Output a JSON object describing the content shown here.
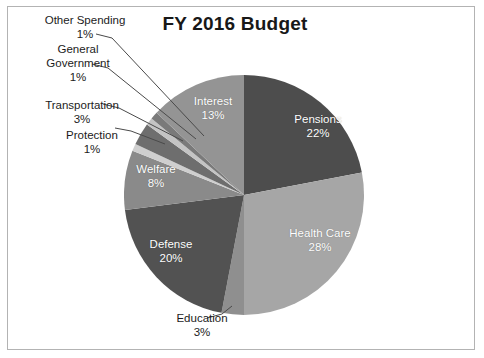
{
  "chart_data": {
    "type": "pie",
    "title": "FY 2016 Budget",
    "xlabel": "",
    "ylabel": "",
    "legend": "none",
    "grid": false,
    "labels_inside": [
      "Pensions",
      "Health Care",
      "Defense",
      "Welfare",
      "Interest"
    ],
    "labels_outside": [
      "Education",
      "Protection",
      "Transportation",
      "General Government",
      "Other Spending"
    ],
    "categories": [
      "Pensions",
      "Health Care",
      "Education",
      "Defense",
      "Welfare",
      "Protection",
      "Transportation",
      "General Government",
      "Other Spending",
      "Interest"
    ],
    "values": [
      22,
      28,
      3,
      20,
      8,
      1,
      3,
      1,
      1,
      13
    ],
    "value_labels": [
      "22%",
      "28%",
      "3%",
      "20%",
      "8%",
      "1%",
      "3%",
      "1%",
      "1%",
      "13%"
    ],
    "units": "percent",
    "total": 100,
    "slices": [
      {
        "name": "Pensions",
        "value": 22,
        "value_label": "22%",
        "color": "#4d4d4d",
        "label_position": "inside",
        "start_deg": 0,
        "end_deg": 79.2
      },
      {
        "name": "Health Care",
        "value": 28,
        "value_label": "28%",
        "color": "#a6a6a6",
        "label_position": "inside",
        "start_deg": 79.2,
        "end_deg": 180.0
      },
      {
        "name": "Education",
        "value": 3,
        "value_label": "3%",
        "color": "#8f8f8f",
        "label_position": "outside",
        "start_deg": 180.0,
        "end_deg": 190.8
      },
      {
        "name": "Defense",
        "value": 20,
        "value_label": "20%",
        "color": "#525252",
        "label_position": "inside",
        "start_deg": 190.8,
        "end_deg": 262.8
      },
      {
        "name": "Welfare",
        "value": 8,
        "value_label": "8%",
        "color": "#8a8a8a",
        "label_position": "inside",
        "start_deg": 262.8,
        "end_deg": 291.6
      },
      {
        "name": "Protection",
        "value": 1,
        "value_label": "1%",
        "color": "#cfcfcf",
        "label_position": "outside",
        "start_deg": 291.6,
        "end_deg": 295.2
      },
      {
        "name": "Transportation",
        "value": 3,
        "value_label": "3%",
        "color": "#6e6e6e",
        "label_position": "outside",
        "start_deg": 295.2,
        "end_deg": 306.0
      },
      {
        "name": "General Government",
        "value": 1,
        "value_label": "1%",
        "color": "#c4c4c4",
        "label_position": "outside",
        "start_deg": 306.0,
        "end_deg": 309.6
      },
      {
        "name": "Other Spending",
        "value": 1,
        "value_label": "1%",
        "color": "#7a7a7a",
        "label_position": "outside",
        "start_deg": 309.6,
        "end_deg": 313.2
      },
      {
        "name": "Interest",
        "value": 13,
        "value_label": "13%",
        "color": "#949494",
        "label_position": "inside",
        "start_deg": 313.2,
        "end_deg": 360.0
      }
    ]
  },
  "chart": {
    "title": "FY 2016 Budget",
    "border_color": "#b3b3b3",
    "background": "#ffffff",
    "label_text_color": "#1c1c1c",
    "inside_label_color": "#ffffff",
    "leader_line_color": "#4a4a4a"
  },
  "inside_labels": {
    "pensions": {
      "name": "Pensions",
      "pct": "22%"
    },
    "health_care": {
      "name": "Health Care",
      "pct": "28%"
    },
    "defense": {
      "name": "Defense",
      "pct": "20%"
    },
    "welfare": {
      "name": "Welfare",
      "pct": "8%"
    },
    "interest": {
      "name": "Interest",
      "pct": "13%"
    }
  },
  "outside_labels": {
    "other_spending": {
      "line1": "Other Spending",
      "pct": "1%"
    },
    "general_government": {
      "line1": "General",
      "line2": "Government",
      "pct": "1%"
    },
    "transportation": {
      "line1": "Transportation",
      "pct": "3%"
    },
    "protection": {
      "line1": "Protection",
      "pct": "1%"
    },
    "education": {
      "line1": "Education",
      "pct": "3%"
    }
  }
}
